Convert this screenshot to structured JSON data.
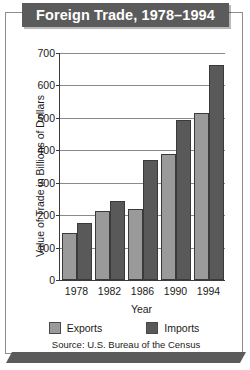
{
  "title": "Foreign Trade, 1978–1994",
  "source": "Source:  U.S. Bureau of the Census",
  "legend": {
    "exports_label": "Exports",
    "imports_label": "Imports"
  },
  "colors": {
    "banner": "#5b5b5b",
    "exports": "#9a9a9a",
    "imports": "#595959",
    "gridline": "#8a8a8a",
    "axis": "#3a3a3a"
  },
  "chart_data": {
    "type": "bar",
    "title": "Foreign Trade, 1978–1994",
    "xlabel": "Year",
    "ylabel": "Value of Trade in Billions of Dollars",
    "categories": [
      "1978",
      "1982",
      "1986",
      "1990",
      "1994"
    ],
    "series": [
      {
        "name": "Exports",
        "values": [
          145,
          212,
          220,
          390,
          515
        ]
      },
      {
        "name": "Imports",
        "values": [
          175,
          245,
          370,
          492,
          663
        ]
      }
    ],
    "ylim": [
      0,
      700
    ],
    "yticks": [
      0,
      100,
      200,
      300,
      400,
      500,
      600,
      700
    ],
    "ytick_labels": [
      "0",
      "100",
      "200",
      "300",
      "400",
      "500",
      "600",
      "700"
    ],
    "grid": true,
    "legend_position": "bottom"
  }
}
